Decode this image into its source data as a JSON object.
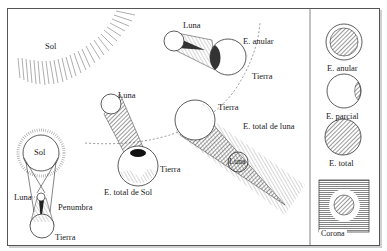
{
  "figure": {
    "labels": {
      "sol_top": "Sol",
      "sol_left": "Sol",
      "luna_left": "Luna",
      "penumbra": "Penumbra",
      "tierra_left": "Tierra",
      "luna_center": "Luna",
      "tierra_center": "Tierra",
      "total_sol": "E. total de Sol",
      "luna_annular": "Luna",
      "anular_top": "E. anular",
      "tierra_annular": "Tierra",
      "tierra_lunar": "Tierra",
      "total_luna": "E. total de luna",
      "luna_in_shadow": "Luna"
    },
    "legend": [
      {
        "label": "E. anular"
      },
      {
        "label": "E. parcial"
      },
      {
        "label": "E. total"
      }
    ],
    "corona_label": "Corona",
    "colors": {
      "ink": "#222222",
      "shade": "#6e6e6e",
      "frame": "#555555"
    }
  }
}
